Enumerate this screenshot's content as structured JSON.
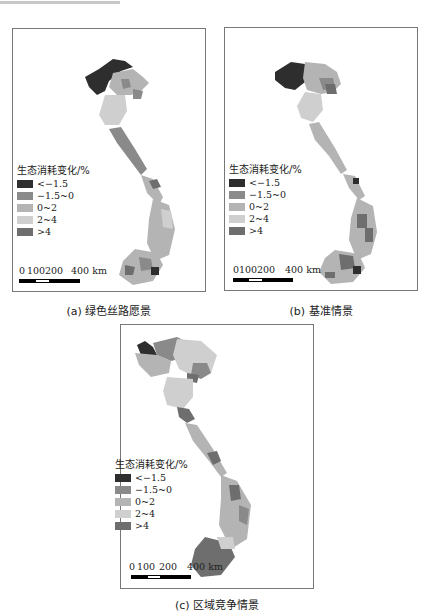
{
  "colors": {
    "lt_neg1_5": "#2e2e2e",
    "neg1_5_0": "#8a8a8a",
    "r0_2": "#b4b4b4",
    "r2_4": "#cfcfcf",
    "gt4": "#6e6e6e",
    "frame": "#777777"
  },
  "legend": {
    "title": "生态消耗变化/%",
    "items": [
      {
        "label": "<−1.5",
        "color_key": "lt_neg1_5"
      },
      {
        "label": "−1.5~0",
        "color_key": "neg1_5_0"
      },
      {
        "label": "0~2",
        "color_key": "r0_2"
      },
      {
        "label": "2~4",
        "color_key": "r2_4"
      },
      {
        "label": ">4",
        "color_key": "gt4"
      }
    ]
  },
  "scale_bar": {
    "ticks": [
      "0",
      "100",
      "200",
      "400 km"
    ]
  },
  "panels": [
    {
      "id": "a",
      "caption": "(a) 绿色丝路愿景"
    },
    {
      "id": "b",
      "caption": "(b) 基准情景"
    },
    {
      "id": "c",
      "caption": "(c) 区域竞争情景"
    }
  ]
}
